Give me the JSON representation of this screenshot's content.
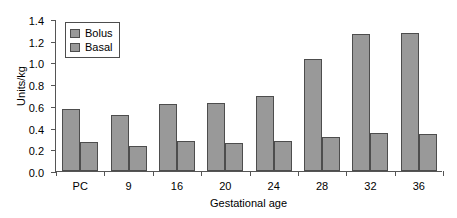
{
  "chart_data": {
    "type": "bar",
    "title": "",
    "subtitle": "",
    "xlabel": "Gestational age",
    "ylabel": "Units/kg",
    "categories": [
      "PC",
      "9",
      "16",
      "20",
      "24",
      "28",
      "32",
      "36"
    ],
    "series": [
      {
        "name": "Bolus",
        "color": "#999999",
        "values": [
          0.57,
          0.52,
          0.62,
          0.63,
          0.69,
          1.03,
          1.26,
          1.27
        ]
      },
      {
        "name": "Basal",
        "color": "#999999",
        "values": [
          0.27,
          0.23,
          0.28,
          0.26,
          0.28,
          0.31,
          0.35,
          0.34
        ]
      }
    ],
    "ylim": [
      0.0,
      1.4
    ],
    "ytick_step": 0.2,
    "ytick_labels": [
      "0.0",
      "0.2",
      "0.4",
      "0.6",
      "0.8",
      "1.0",
      "1.2",
      "1.4"
    ],
    "ytick_values": [
      0.0,
      0.2,
      0.4,
      0.6,
      0.8,
      1.0,
      1.2,
      1.4
    ],
    "grid": false,
    "legend_position": "top-left-inside",
    "bar_border_color": "#4d4d4d",
    "axis_color": "#555555"
  },
  "legend": {
    "entries": [
      {
        "label": "Bolus"
      },
      {
        "label": "Basal"
      }
    ]
  }
}
